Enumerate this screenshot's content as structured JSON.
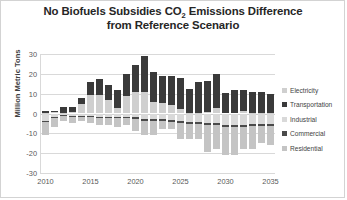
{
  "chart_data": {
    "type": "bar",
    "subtype": "stacked-bar-diverging",
    "title": "No Biofuels Subsidies  CO2 Emissions  Difference from Reference Scenario",
    "title_line1": "No Biofuels Subsidies  CO",
    "title_line1_sub": "2",
    "title_line1_rest": " Emissions  Difference",
    "title_line2": "from Reference Scenario",
    "xlabel": "",
    "ylabel": "Million Metric Tons",
    "ylim": [
      -30,
      30
    ],
    "ytick_values": [
      30,
      20,
      10,
      0,
      -10,
      -20,
      -30
    ],
    "ytick_labels": [
      "30",
      "20",
      "10",
      "0",
      "-10",
      "-20",
      "-30"
    ],
    "xlim": [
      2010,
      2035
    ],
    "xtick_values": [
      2010,
      2015,
      2020,
      2025,
      2030,
      2035
    ],
    "xtick_labels": [
      "2010",
      "2015",
      "2020",
      "2025",
      "2030",
      "2035"
    ],
    "grid": "horizontal",
    "legend_position": "right",
    "categories": [
      "2010",
      "2011",
      "2012",
      "2013",
      "2014",
      "2015",
      "2016",
      "2017",
      "2018",
      "2019",
      "2020",
      "2021",
      "2022",
      "2023",
      "2024",
      "2025",
      "2026",
      "2027",
      "2028",
      "2029",
      "2030",
      "2031",
      "2032",
      "2033",
      "2034",
      "2035"
    ],
    "series": [
      {
        "name": "Electricity",
        "color": "#cfcfcf",
        "values": [
          0.4,
          0.6,
          0.5,
          0.6,
          4.6,
          9.5,
          9.5,
          7.0,
          3.0,
          8.6,
          10.8,
          11.0,
          5.6,
          5.5,
          4.4,
          2.5,
          0.5,
          0.5,
          0.8,
          3.0,
          0.0,
          0.0,
          1.3,
          0.4,
          0.3,
          0.3
        ]
      },
      {
        "name": "Transportation",
        "color": "#3a3a3a",
        "values": [
          1.0,
          0.8,
          2.6,
          2.5,
          3.0,
          6.5,
          7.7,
          7.6,
          9.0,
          11.4,
          13.5,
          18.0,
          15.2,
          13.6,
          14.7,
          15.5,
          12.0,
          15.3,
          15.8,
          17.0,
          10.3,
          11.7,
          10.3,
          10.4,
          10.3,
          9.3
        ]
      },
      {
        "name": "Industrial",
        "color": "#d9d9d9",
        "values": [
          -4.0,
          -2.0,
          -1.0,
          -1.5,
          -1.2,
          -1.5,
          -1.6,
          -1.6,
          -1.6,
          -2.0,
          -2.0,
          -3.0,
          -3.0,
          -3.0,
          -3.5,
          -4.0,
          -4.5,
          -4.5,
          -5.0,
          -5.0,
          -6.0,
          -6.0,
          -6.0,
          -5.5,
          -5.5,
          -5.5
        ]
      },
      {
        "name": "Commercial",
        "color": "#4a4a4a",
        "values": [
          -0.4,
          -0.4,
          -0.4,
          -0.4,
          -0.4,
          -0.4,
          -0.5,
          -0.5,
          -0.5,
          -0.5,
          -0.6,
          -0.6,
          -0.6,
          -0.6,
          -0.7,
          -0.7,
          -0.8,
          -0.8,
          -0.8,
          -0.8,
          -0.9,
          -0.9,
          -0.9,
          -0.9,
          -0.9,
          -0.9
        ]
      },
      {
        "name": "Residential",
        "color": "#c4c4c4",
        "values": [
          -6.6,
          -4.6,
          -2.6,
          -3.1,
          -2.4,
          -3.1,
          -3.9,
          -3.9,
          -4.9,
          -3.5,
          -6.4,
          -7.4,
          -7.4,
          -4.4,
          -3.8,
          -8.3,
          -7.7,
          -7.7,
          -13.7,
          -12.2,
          -14.1,
          -14.1,
          -11.1,
          -11.6,
          -8.6,
          -9.6
        ]
      }
    ],
    "stack_totals_positive": [
      1.4,
      1.4,
      3.1,
      3.1,
      7.6,
      16.0,
      17.2,
      14.6,
      12.0,
      20.0,
      24.3,
      29.0,
      20.8,
      19.1,
      19.1,
      18.0,
      12.5,
      15.8,
      16.6,
      20.0,
      10.3,
      11.7,
      11.6,
      10.8,
      10.6,
      9.6
    ],
    "stack_totals_negative": [
      -11.0,
      -7.0,
      -4.0,
      -5.0,
      -4.0,
      -5.0,
      -6.0,
      -6.0,
      -7.0,
      -6.0,
      -9.0,
      -11.0,
      -11.0,
      -8.0,
      -8.0,
      -13.0,
      -13.0,
      -13.0,
      -19.5,
      -18.0,
      -21.0,
      -21.0,
      -18.0,
      -18.0,
      -15.0,
      -16.0
    ],
    "annotations": []
  },
  "legend": {
    "items": [
      {
        "label": "Electricity",
        "color": "#cfcfcf"
      },
      {
        "label": "Transportation",
        "color": "#3a3a3a"
      },
      {
        "label": "Industrial",
        "color": "#d9d9d9"
      },
      {
        "label": "Commercial",
        "color": "#4a4a4a"
      },
      {
        "label": "Residential",
        "color": "#c4c4c4"
      }
    ]
  },
  "bottom_caption": {
    "text": ""
  },
  "colors": {
    "grid": "#d9d9d9",
    "axis_text": "#595959",
    "title_text": "#262626",
    "frame_border": "#d3d3d3",
    "background": "#ffffff"
  }
}
